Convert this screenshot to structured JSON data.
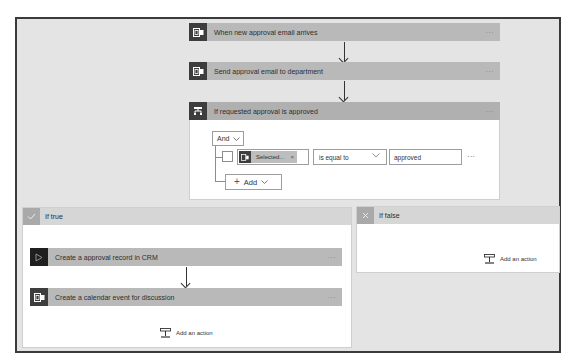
{
  "flow": {
    "steps": [
      {
        "title": "When new approval email arrives",
        "icon": "outlook-icon",
        "more": "···"
      },
      {
        "title": "Send approval email to department",
        "icon": "outlook-icon",
        "more": "···"
      }
    ],
    "condition": {
      "title": "If requested approval is approved",
      "icon": "condition-icon",
      "more": "···",
      "group_operator": "And",
      "rows": [
        {
          "token_label": "Selected...",
          "token_remove": "×",
          "operator": "is equal to",
          "value": "approved",
          "more": "···"
        }
      ],
      "add_label": "Add"
    },
    "if_true": {
      "title": "If true",
      "icon": "check-icon",
      "actions": [
        {
          "title": "Create a approval record in CRM",
          "icon": "crm-icon",
          "more": "···"
        },
        {
          "title": "Create a calendar event for discussion",
          "icon": "outlook-icon",
          "more": "···"
        }
      ],
      "add_action_label": "Add an action"
    },
    "if_false": {
      "title": "If false",
      "icon": "x-icon",
      "add_action_label": "Add an action"
    }
  },
  "colors": {
    "canvas": "#e4e4e4",
    "card_header": "#b9b9b9",
    "icon_dark": "#3d3d3d",
    "frame_border": "#3a3a3a"
  }
}
